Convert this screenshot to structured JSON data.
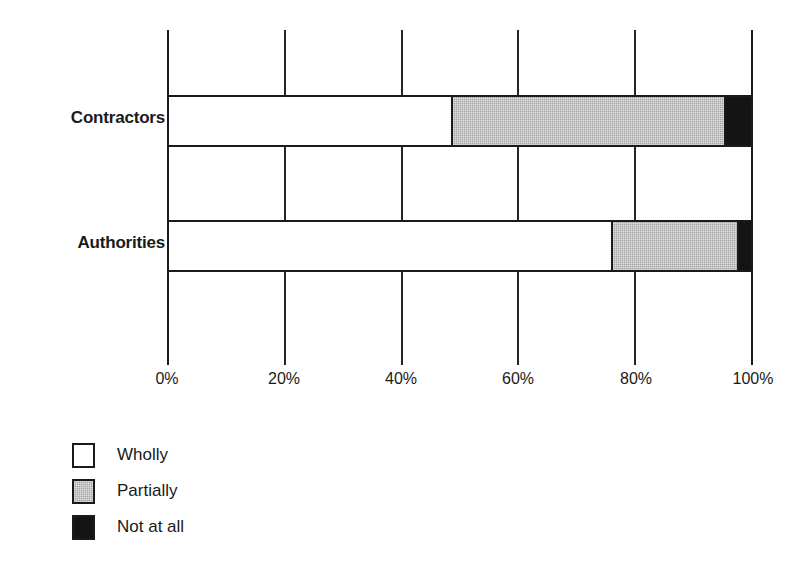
{
  "chart_data": {
    "type": "bar",
    "orientation": "horizontal",
    "stacked": true,
    "stack_mode": "percent",
    "title": "",
    "subtitle": "",
    "xlabel": "",
    "ylabel": "",
    "xlim": [
      0,
      100
    ],
    "xticks": [
      0,
      20,
      40,
      60,
      80,
      100
    ],
    "xtick_labels": [
      "0%",
      "20%",
      "40%",
      "60%",
      "80%",
      "100%"
    ],
    "grid": true,
    "grid_axis": "x",
    "legend_position": "bottom-left",
    "categories": [
      "Contractors",
      "Authorities"
    ],
    "series": [
      {
        "name": "Wholly",
        "color": "#ffffff",
        "values": [
          48.5,
          76.0
        ]
      },
      {
        "name": "Partially",
        "color": "#a8a8a8",
        "values": [
          46.9,
          21.6
        ]
      },
      {
        "name": "Not at all",
        "color": "#141414",
        "values": [
          4.6,
          2.4
        ]
      }
    ],
    "annotations": []
  },
  "axis": {
    "ticks": [
      {
        "label": "0%",
        "value": 0
      },
      {
        "label": "20%",
        "value": 20
      },
      {
        "label": "40%",
        "value": 40
      },
      {
        "label": "60%",
        "value": 60
      },
      {
        "label": "80%",
        "value": 80
      },
      {
        "label": "100%",
        "value": 100
      }
    ]
  },
  "legend": {
    "items": [
      {
        "label": "Wholly",
        "swatch": "white"
      },
      {
        "label": "Partially",
        "swatch": "gray"
      },
      {
        "label": "Not at all",
        "swatch": "black"
      }
    ]
  },
  "category_labels": [
    {
      "label": "Contractors"
    },
    {
      "label": "Authorities"
    }
  ]
}
